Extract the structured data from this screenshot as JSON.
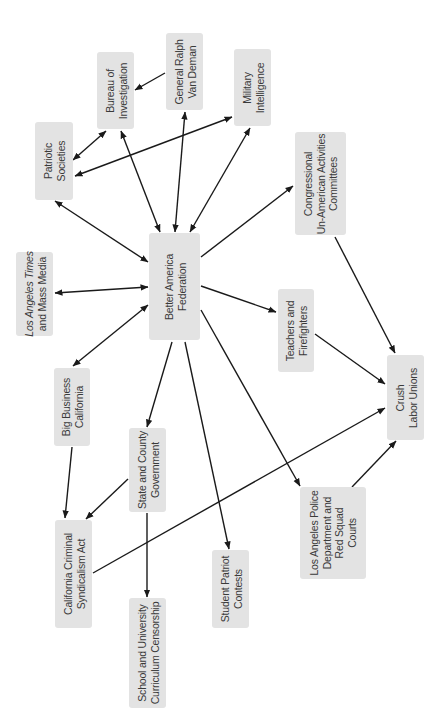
{
  "nodes": [
    {
      "id": "bureau",
      "name": "node-bureau-of-investigation",
      "lines": [
        "Bureau of",
        "Investigation"
      ]
    },
    {
      "id": "vandeman",
      "name": "node-general-ralph-van-deman",
      "lines": [
        "General Ralph",
        "Van Deman"
      ]
    },
    {
      "id": "military",
      "name": "node-military-intelligence",
      "lines": [
        "Military",
        "Intelligence"
      ]
    },
    {
      "id": "patriotic",
      "name": "node-patriotic-societies",
      "lines": [
        "Patriotic",
        "Societies"
      ]
    },
    {
      "id": "congress",
      "name": "node-congressional-committees",
      "lines": [
        "Congressional",
        "Un-American Activities",
        "Committees"
      ]
    },
    {
      "id": "baf",
      "name": "node-better-america-federation",
      "lines": [
        "Better America",
        "Federation"
      ]
    },
    {
      "id": "latimes",
      "name": "node-los-angeles-times",
      "lines": [
        "Los Angeles Times",
        "and Mass Media"
      ],
      "italic_prefix": "Los Angeles Times"
    },
    {
      "id": "teachers",
      "name": "node-teachers-firefighters",
      "lines": [
        "Teachers and",
        "Firefighters"
      ]
    },
    {
      "id": "crush",
      "name": "node-crush-labor-unions",
      "lines": [
        "Crush",
        "Labor Unions"
      ]
    },
    {
      "id": "bigbiz",
      "name": "node-big-business-california",
      "lines": [
        "Big Business",
        "California"
      ]
    },
    {
      "id": "state",
      "name": "node-state-county-government",
      "lines": [
        "State and County",
        "Government"
      ]
    },
    {
      "id": "ccsa",
      "name": "node-california-criminal-syndicalism-act",
      "lines": [
        "California Criminal",
        "Syndicalism Act"
      ]
    },
    {
      "id": "lapd",
      "name": "node-lapd-red-squad-courts",
      "lines": [
        "Los Angeles Police",
        "Department and",
        "Red Squad",
        "Courts"
      ]
    },
    {
      "id": "student",
      "name": "node-student-patriot-contests",
      "lines": [
        "Student Patriot",
        "Contests"
      ]
    },
    {
      "id": "school",
      "name": "node-school-curriculum-censorship",
      "lines": [
        "School and University",
        "Curriculum Censorship"
      ]
    }
  ],
  "edges": [
    {
      "from": "vandeman",
      "to": "bureau",
      "type": "directed"
    },
    {
      "from": "patriotic",
      "to": "bureau",
      "type": "bidirectional"
    },
    {
      "from": "patriotic",
      "to": "military",
      "type": "bidirectional"
    },
    {
      "from": "baf",
      "to": "bureau",
      "type": "bidirectional"
    },
    {
      "from": "baf",
      "to": "vandeman",
      "type": "bidirectional"
    },
    {
      "from": "baf",
      "to": "military",
      "type": "bidirectional"
    },
    {
      "from": "baf",
      "to": "patriotic",
      "type": "bidirectional"
    },
    {
      "from": "baf",
      "to": "congress",
      "type": "directed"
    },
    {
      "from": "baf",
      "to": "latimes",
      "type": "bidirectional"
    },
    {
      "from": "baf",
      "to": "bigbiz",
      "type": "bidirectional"
    },
    {
      "from": "baf",
      "to": "teachers",
      "type": "directed"
    },
    {
      "from": "baf",
      "to": "state",
      "type": "directed"
    },
    {
      "from": "baf",
      "to": "student",
      "type": "directed"
    },
    {
      "from": "baf",
      "to": "lapd",
      "type": "directed"
    },
    {
      "from": "congress",
      "to": "crush",
      "type": "directed"
    },
    {
      "from": "teachers",
      "to": "crush",
      "type": "directed"
    },
    {
      "from": "lapd",
      "to": "crush",
      "type": "directed"
    },
    {
      "from": "ccsa",
      "to": "crush",
      "type": "directed"
    },
    {
      "from": "bigbiz",
      "to": "ccsa",
      "type": "directed"
    },
    {
      "from": "state",
      "to": "ccsa",
      "type": "directed"
    },
    {
      "from": "state",
      "to": "school",
      "type": "directed"
    }
  ]
}
